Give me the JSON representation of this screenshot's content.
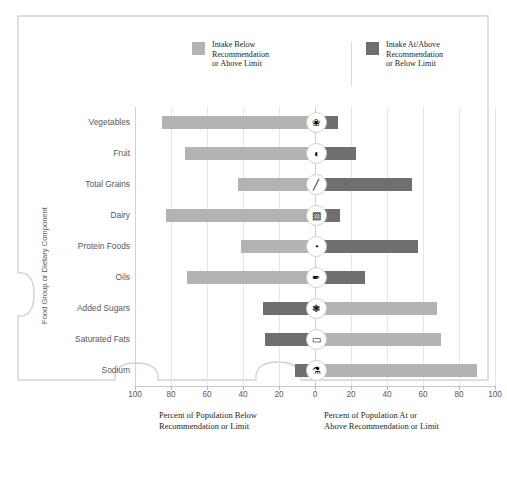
{
  "legend": {
    "items": [
      {
        "label": "Intake Below\nRecommendation\nor Above Limit",
        "color": "#b3b3b3",
        "name": "below"
      },
      {
        "label": "Intake At/Above\nRecommendation\nor Below Limit",
        "color": "#6f6f6f",
        "name": "above"
      }
    ]
  },
  "axes": {
    "ylabel": "Food Group or Dietary Component",
    "tick_labels": [
      "100",
      "80",
      "60",
      "40",
      "20",
      "0",
      "20",
      "40",
      "60",
      "80",
      "100"
    ],
    "xcaption_left": "Percent of Population Below\nRecommendation or Limit",
    "xcaption_right": "Percent of Population At or\nAbove Recommendation or Limit"
  },
  "chart_data": {
    "type": "bar",
    "orientation": "horizontal-diverging",
    "title": "",
    "xlabel": "Percent of Population",
    "ylabel": "Food Group or Dietary Component",
    "xlim": [
      -100,
      100
    ],
    "grid": true,
    "legend_position": "top",
    "categories": [
      "Vegetables",
      "Fruit",
      "Total Grains",
      "Dairy",
      "Protein Foods",
      "Oils",
      "Added Sugars",
      "Saturated Fats",
      "Sodium"
    ],
    "series": [
      {
        "name": "Intake Below Recommendation or Above Limit",
        "color": "#b3b3b3",
        "values": [
          85,
          72,
          43,
          83,
          41,
          71,
          68,
          70,
          90
        ]
      },
      {
        "name": "Intake At/Above Recommendation or Below Limit",
        "color": "#6f6f6f",
        "values": [
          13,
          23,
          54,
          14,
          57,
          28,
          29,
          28,
          11
        ]
      }
    ],
    "rows": [
      {
        "category": "Vegetables",
        "left_value": 85,
        "right_value": 13,
        "left_series": "below",
        "right_series": "above",
        "icon": "vegetables-icon",
        "glyph": "❀"
      },
      {
        "category": "Fruit",
        "left_value": 72,
        "right_value": 23,
        "left_series": "below",
        "right_series": "above",
        "icon": "fruit-icon",
        "glyph": "◖"
      },
      {
        "category": "Total Grains",
        "left_value": 43,
        "right_value": 54,
        "left_series": "below",
        "right_series": "above",
        "icon": "grains-icon",
        "glyph": "╱"
      },
      {
        "category": "Dairy",
        "left_value": 83,
        "right_value": 14,
        "left_series": "below",
        "right_series": "above",
        "icon": "dairy-icon",
        "glyph": "▧"
      },
      {
        "category": "Protein Foods",
        "left_value": 41,
        "right_value": 57,
        "left_series": "below",
        "right_series": "above",
        "icon": "protein-icon",
        "glyph": "◔"
      },
      {
        "category": "Oils",
        "left_value": 71,
        "right_value": 28,
        "left_series": "below",
        "right_series": "above",
        "icon": "oils-icon",
        "glyph": "✒"
      },
      {
        "category": "Added Sugars",
        "left_value": 29,
        "right_value": 68,
        "left_series": "above",
        "right_series": "below",
        "icon": "added-sugars-icon",
        "glyph": "❃"
      },
      {
        "category": "Saturated Fats",
        "left_value": 28,
        "right_value": 70,
        "left_series": "above",
        "right_series": "below",
        "icon": "saturated-fats-icon",
        "glyph": "▭"
      },
      {
        "category": "Sodium",
        "left_value": 11,
        "right_value": 90,
        "left_series": "above",
        "right_series": "below",
        "icon": "sodium-icon",
        "glyph": "⚗"
      }
    ]
  },
  "style": {
    "color_below": "#b3b3b3",
    "color_above": "#6f6f6f",
    "grid_color": "#e6e6e6",
    "text_color": "#58585a",
    "frame_color": "#d3d3d3"
  }
}
